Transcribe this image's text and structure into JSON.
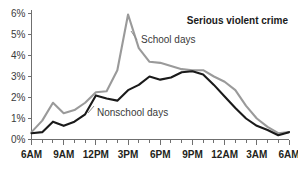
{
  "chart_data": {
    "type": "line",
    "title": "Serious violent crime",
    "xlabel": "",
    "ylabel": "",
    "ylim": [
      0,
      6
    ],
    "yticks": [
      "0%",
      "1%",
      "2%",
      "3%",
      "4%",
      "5%",
      "6%"
    ],
    "ytick_values": [
      0,
      1,
      2,
      3,
      4,
      5,
      6
    ],
    "grid": false,
    "legend_position": "inline-annotations",
    "x": [
      "6AM",
      "7AM",
      "8AM",
      "9AM",
      "10AM",
      "11AM",
      "12PM",
      "1PM",
      "2PM",
      "3PM",
      "4PM",
      "5PM",
      "6PM",
      "7PM",
      "8PM",
      "9PM",
      "10PM",
      "11PM",
      "12AM",
      "1AM",
      "2AM",
      "3AM",
      "4AM",
      "5AM",
      "6AM"
    ],
    "xtick_labels": [
      "6AM",
      "9AM",
      "12PM",
      "3PM",
      "6PM",
      "9PM",
      "12AM",
      "3AM",
      "6AM"
    ],
    "xtick_indices": [
      0,
      3,
      6,
      9,
      12,
      15,
      18,
      21,
      24
    ],
    "series": [
      {
        "name": "School days",
        "color": "#9a9a9a",
        "label_text": "School days",
        "values": [
          0.35,
          0.9,
          1.75,
          1.25,
          1.4,
          1.75,
          2.25,
          2.3,
          3.3,
          5.95,
          4.35,
          3.7,
          3.65,
          3.5,
          3.35,
          3.3,
          3.3,
          3.0,
          2.75,
          2.35,
          1.6,
          1.0,
          0.6,
          0.3,
          0.35
        ]
      },
      {
        "name": "Nonschool days",
        "color": "#1a1a1a",
        "label_text": "Nonschool days",
        "values": [
          0.3,
          0.35,
          0.85,
          0.65,
          0.85,
          1.2,
          2.1,
          1.95,
          1.85,
          2.35,
          2.6,
          3.0,
          2.85,
          2.95,
          3.2,
          3.25,
          3.1,
          2.6,
          2.05,
          1.5,
          1.0,
          0.65,
          0.45,
          0.2,
          0.35
        ]
      }
    ],
    "annotations": [
      {
        "text": "Serious violent crime",
        "style": "bold"
      },
      {
        "text": "School days",
        "style": "plain"
      },
      {
        "text": "Nonschool days",
        "style": "plain"
      }
    ]
  }
}
